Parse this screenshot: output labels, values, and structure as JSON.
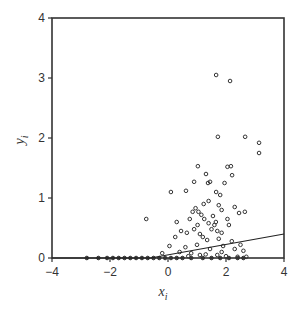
{
  "chart_data": {
    "type": "scatter",
    "title": "",
    "xlabel": "x_i",
    "ylabel": "y_i",
    "xlim": [
      -4,
      4
    ],
    "ylim": [
      0,
      4
    ],
    "x_ticks": [
      -4,
      -2,
      0,
      2,
      4
    ],
    "y_ticks": [
      0,
      1,
      2,
      3,
      4
    ],
    "grid": false,
    "legend": null,
    "series": [
      {
        "name": "observations",
        "kind": "scatter",
        "marker": "open-circle",
        "points": [
          [
            1.66,
            3.05
          ],
          [
            2.14,
            2.95
          ],
          [
            1.72,
            2.02
          ],
          [
            2.66,
            2.02
          ],
          [
            3.14,
            1.92
          ],
          [
            3.14,
            1.75
          ],
          [
            1.03,
            1.53
          ],
          [
            2.17,
            1.53
          ],
          [
            2.21,
            1.38
          ],
          [
            1.31,
            1.4
          ],
          [
            1.45,
            1.27
          ],
          [
            0.9,
            1.27
          ],
          [
            1.38,
            1.25
          ],
          [
            1.66,
            1.1
          ],
          [
            1.95,
            1.25
          ],
          [
            2.05,
            1.52
          ],
          [
            0.1,
            1.1
          ],
          [
            0.62,
            1.12
          ],
          [
            1.8,
            1.05
          ],
          [
            1.4,
            0.95
          ],
          [
            0.95,
            0.83
          ],
          [
            2.3,
            0.85
          ],
          [
            2.65,
            0.77
          ],
          [
            2.45,
            0.75
          ],
          [
            1.05,
            0.77
          ],
          [
            1.23,
            0.9
          ],
          [
            1.75,
            0.88
          ],
          [
            1.85,
            0.8
          ],
          [
            0.85,
            0.77
          ],
          [
            1.15,
            0.72
          ],
          [
            1.25,
            0.65
          ],
          [
            1.55,
            0.7
          ],
          [
            1.65,
            0.6
          ],
          [
            2.05,
            0.65
          ],
          [
            2.1,
            0.55
          ],
          [
            0.3,
            0.6
          ],
          [
            0.75,
            0.65
          ],
          [
            0.45,
            0.45
          ],
          [
            1.02,
            0.55
          ],
          [
            1.4,
            0.58
          ],
          [
            1.5,
            0.48
          ],
          [
            1.6,
            0.55
          ],
          [
            1.7,
            0.45
          ],
          [
            1.85,
            0.42
          ],
          [
            1.1,
            0.4
          ],
          [
            0.9,
            0.48
          ],
          [
            0.65,
            0.42
          ],
          [
            1.2,
            0.35
          ],
          [
            1.35,
            0.3
          ],
          [
            1.75,
            0.32
          ],
          [
            2.2,
            0.28
          ],
          [
            2.5,
            0.22
          ],
          [
            1.9,
            0.2
          ],
          [
            1.0,
            0.22
          ],
          [
            0.6,
            0.18
          ],
          [
            1.45,
            0.15
          ],
          [
            2.3,
            0.15
          ],
          [
            2.6,
            0.12
          ],
          [
            1.85,
            0.1
          ],
          [
            -0.75,
            0.65
          ],
          [
            0.25,
            0.35
          ],
          [
            0.05,
            0.2
          ],
          [
            -0.2,
            0.08
          ],
          [
            0.4,
            0.1
          ],
          [
            0.8,
            0.08
          ],
          [
            1.3,
            0.06
          ],
          [
            1.7,
            0.05
          ],
          [
            2.0,
            0.03
          ],
          [
            2.4,
            0.02
          ],
          [
            2.7,
            0.02
          ],
          [
            1.1,
            0.05
          ],
          [
            0.7,
            0.03
          ],
          [
            -2.8,
            0.0
          ],
          [
            -2.4,
            0.0
          ],
          [
            -2.1,
            0.0
          ],
          [
            -1.9,
            0.0
          ],
          [
            -1.7,
            0.0
          ],
          [
            -1.5,
            0.0
          ],
          [
            -1.3,
            0.0
          ],
          [
            -1.1,
            0.0
          ],
          [
            -0.9,
            0.0
          ],
          [
            -0.7,
            0.0
          ],
          [
            -0.5,
            0.0
          ],
          [
            -0.3,
            0.0
          ],
          [
            -0.1,
            0.0
          ],
          [
            0.1,
            0.0
          ],
          [
            0.3,
            0.0
          ],
          [
            0.5,
            0.0
          ],
          [
            0.8,
            0.0
          ],
          [
            1.2,
            0.0
          ],
          [
            1.5,
            0.0
          ],
          [
            1.8,
            0.0
          ],
          [
            2.1,
            0.0
          ],
          [
            2.4,
            0.0
          ],
          [
            2.6,
            0.0
          ]
        ]
      },
      {
        "name": "fitted-line",
        "kind": "line",
        "points": [
          [
            -4,
            0
          ],
          [
            -0.6,
            0
          ],
          [
            4,
            0.4
          ]
        ]
      }
    ]
  },
  "labels": {
    "xlabel_main": "x",
    "xlabel_sub": "i",
    "ylabel_main": "y",
    "ylabel_sub": "i"
  }
}
